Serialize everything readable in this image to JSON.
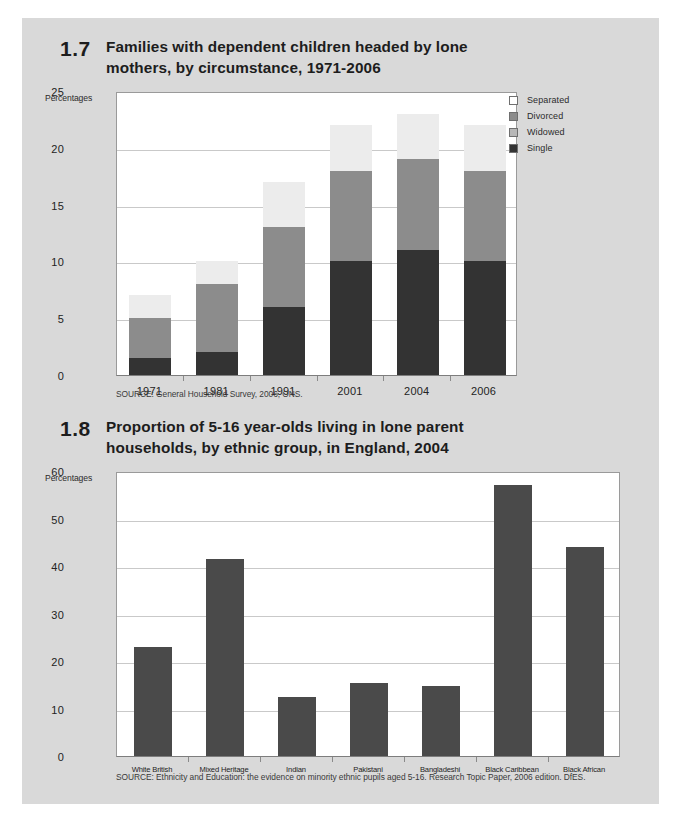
{
  "page": {
    "background_color": "#ffffff",
    "panel_color": "#d9d9d9"
  },
  "palette": {
    "separated": "#f2f2f2",
    "divorced": "#d4d4d4",
    "widowed": "#8c8c8c",
    "single": "#333333",
    "bar_solid": "#4a4a4a",
    "grid": "#c9c9c9",
    "axis": "#8a8a8a",
    "text": "#1d1d1d"
  },
  "figure1": {
    "number": "1.7",
    "title": "Families with dependent children headed by lone mothers, by circumstance, 1971-2006",
    "axis_unit": "Percentages",
    "source": "SOURCE: General Household Survey, 2006, ONS.",
    "legend": [
      {
        "label": "Separated",
        "color": "#ffffff"
      },
      {
        "label": "Divorced",
        "color": "#8c8c8c"
      },
      {
        "label": "Widowed",
        "color": "#b8b8b8"
      },
      {
        "label": "Single",
        "color": "#333333"
      }
    ],
    "chart_data": {
      "type": "bar",
      "subtype": "stacked",
      "title": "Families with dependent children headed by lone mothers, by circumstance, 1971-2006",
      "xlabel": "",
      "ylabel": "Percentages",
      "ylim": [
        0,
        25
      ],
      "yticks": [
        0,
        5,
        10,
        15,
        20,
        25
      ],
      "grid": true,
      "legend_position": "top-right",
      "categories": [
        "1971",
        "1981",
        "1991",
        "2001",
        "2004",
        "2006"
      ],
      "series": [
        {
          "name": "Single",
          "color": "#333333",
          "values": [
            1.5,
            2.0,
            6.0,
            10.0,
            11.0,
            10.0
          ]
        },
        {
          "name": "Divorced",
          "color": "#8c8c8c",
          "values": [
            3.5,
            6.0,
            7.0,
            8.0,
            8.0,
            8.0
          ]
        },
        {
          "name": "Widowed",
          "color": "#b8b8b8",
          "values": [
            0,
            0,
            0,
            0,
            0,
            0
          ]
        },
        {
          "name": "Separated",
          "color": "#ececec",
          "values": [
            2.0,
            2.0,
            4.0,
            4.0,
            4.0,
            4.0
          ]
        }
      ],
      "totals": [
        7,
        10,
        17,
        22,
        23,
        22
      ]
    }
  },
  "figure2": {
    "number": "1.8",
    "title": "Proportion of 5-16 year-olds living in lone parent households, by ethnic group, in England, 2004",
    "axis_unit": "Percentages",
    "source": "SOURCE: Ethnicity and Education: the evidence on minority ethnic pupils aged 5-16. Research Topic Paper, 2006 edition. DfES.",
    "chart_data": {
      "type": "bar",
      "subtype": "vertical",
      "title": "Proportion of 5-16 year-olds living in lone parent households, by ethnic group, in England, 2004",
      "xlabel": "",
      "ylabel": "Percentages",
      "ylim": [
        0,
        60
      ],
      "yticks": [
        0,
        10,
        20,
        30,
        40,
        50,
        60
      ],
      "grid": true,
      "bar_color": "#4a4a4a",
      "categories": [
        "White British",
        "Mixed Heritage",
        "Indian",
        "Pakistani",
        "Bangladeshi",
        "Black Caribbean",
        "Black African"
      ],
      "values": [
        23,
        41.5,
        12.5,
        15.3,
        14.7,
        57,
        44
      ]
    }
  }
}
